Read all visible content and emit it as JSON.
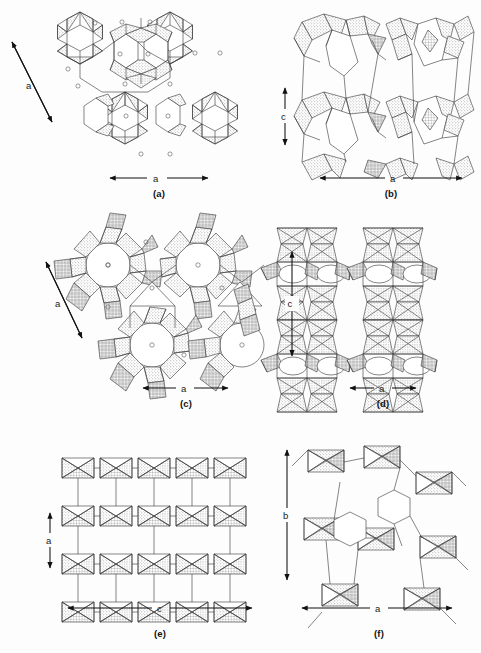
{
  "figure": {
    "kind": "crystal-structure-framework-panels",
    "background_color": "#fdfdfd",
    "line_color": "#3b3b3b",
    "arrow_color": "#111111",
    "fill_styles": [
      "stipple-gray",
      "cross-hatch",
      "open-white"
    ],
    "panel_count": 6
  },
  "panels": [
    {
      "id": "a",
      "caption": "(a)",
      "axes": [
        {
          "name": "diagonal-axis-a",
          "label": "a",
          "orientation": "diagonal",
          "direction": "double"
        },
        {
          "name": "horizontal-axis-a",
          "label": "a",
          "orientation": "horizontal",
          "direction": "double"
        }
      ],
      "description": "Framework projection with six-ring star motifs and open hexagonal channels, stippled tetrahedra, small circular cation sites"
    },
    {
      "id": "b",
      "caption": "(b)",
      "axes": [
        {
          "name": "vertical-axis-c",
          "label": "c",
          "orientation": "vertical",
          "direction": "double"
        },
        {
          "name": "horizontal-axis-a",
          "label": "a",
          "orientation": "horizontal",
          "direction": "double"
        }
      ],
      "description": "Projection showing elongated channels bounded by stippled and cross-hatched tetrahedra"
    },
    {
      "id": "c",
      "caption": "(c)",
      "axes": [
        {
          "name": "diagonal-axis-a",
          "label": "a",
          "orientation": "diagonal",
          "direction": "double"
        },
        {
          "name": "horizontal-axis-a",
          "label": "a",
          "orientation": "horizontal",
          "direction": "double"
        }
      ],
      "description": "Four-fold pinwheel units around large circular pores with cross-hatched outer tetrahedra"
    },
    {
      "id": "d",
      "caption": "(d)",
      "axes": [
        {
          "name": "vertical-axis-c",
          "label": "c",
          "orientation": "vertical",
          "direction": "double"
        },
        {
          "name": "horizontal-axis-a",
          "label": "a",
          "orientation": "horizontal",
          "direction": "double"
        }
      ],
      "description": "Dense layered framework with rows of oval eight-ring channel openings"
    },
    {
      "id": "e",
      "caption": "(e)",
      "axes": [
        {
          "name": "vertical-axis-a",
          "label": "a",
          "orientation": "vertical",
          "direction": "double"
        },
        {
          "name": "horizontal-axis-c",
          "label": "c",
          "orientation": "horizontal",
          "direction": "double"
        }
      ],
      "description": "Wide layered framework with horizontal interlayer channels running along c"
    },
    {
      "id": "f",
      "caption": "(f)",
      "axes": [
        {
          "name": "vertical-axis-b",
          "label": "b",
          "orientation": "vertical",
          "direction": "double"
        },
        {
          "name": "horizontal-axis-a",
          "label": "a",
          "orientation": "horizontal",
          "direction": "double"
        }
      ],
      "description": "Framework with hexagonal rings formed by stippled and cross-hatched tetrahedra"
    }
  ]
}
